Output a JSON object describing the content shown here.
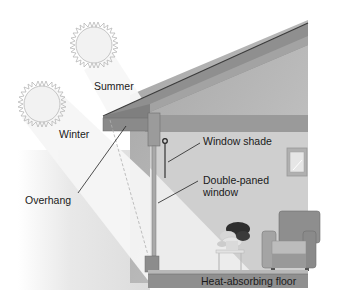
{
  "diagram": {
    "type": "passive-solar-house-cross-section",
    "labels": {
      "summer": "Summer",
      "winter": "Winter",
      "overhang": "Overhang",
      "window_shade": "Window shade",
      "double_paned_line1": "Double-paned",
      "double_paned_line2": "window",
      "floor": "Heat-absorbing floor"
    },
    "elements": [
      "summer-sun",
      "winter-sun",
      "summer-sun-rays",
      "winter-sun-rays",
      "roof-overhang",
      "wall-post",
      "window-shade",
      "double-paned-window",
      "wall-mirror",
      "armchair",
      "potted-plant",
      "plant-table",
      "heat-absorbing-floor"
    ],
    "colors": {
      "background": "#ffffff",
      "wall": "#b4b4b4",
      "wall_light": "#d9d9d9",
      "roof": "#8c8c8c",
      "beam": "#9a9a9a",
      "floor": "#8f8f8f",
      "beam_light": "#f3f3f3",
      "sun_stroke": "#bdbdbd",
      "text": "#1a1a1a"
    }
  }
}
